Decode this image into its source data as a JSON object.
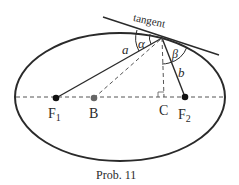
{
  "diagram": {
    "title": "Prob. 11",
    "shape": "ellipse",
    "tangent_label": "tangent",
    "points": {
      "F1": "F1",
      "F2": "F2",
      "B": "B",
      "C": "C"
    },
    "labels": {
      "F1_main": "F",
      "F1_sub": "1",
      "F2_main": "F",
      "F2_sub": "2",
      "B": "B",
      "C": "C",
      "a": "a",
      "b": "b",
      "alpha": "α",
      "beta": "β"
    },
    "colors": {
      "stroke": "#2a2a2a",
      "dashed": "#555555",
      "point_B": "#666666"
    }
  }
}
